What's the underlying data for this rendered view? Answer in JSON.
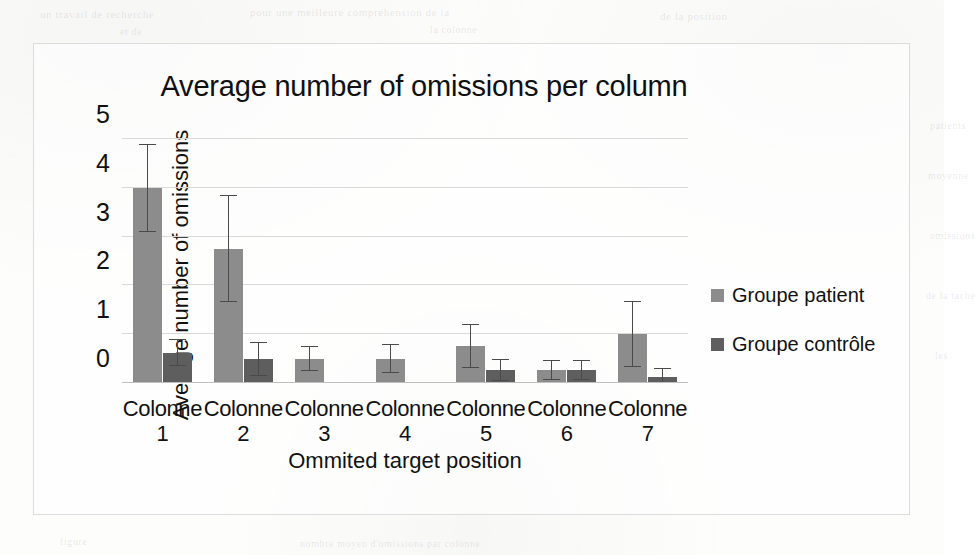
{
  "figure": {
    "border_color": "#dcdcdc",
    "background": "#fdfdfc"
  },
  "chart_data": {
    "type": "bar",
    "title": "Average number of omissions per column",
    "xlabel": "Ommited target position",
    "ylabel": "Average number of omissions",
    "categories": [
      "Colonne 1",
      "Colonne 2",
      "Colonne 3",
      "Colonne 4",
      "Colonne 5",
      "Colonne 6",
      "Colonne 7"
    ],
    "category_lines": [
      [
        "Colonne",
        "1"
      ],
      [
        "Colonne",
        "2"
      ],
      [
        "Colonne",
        "3"
      ],
      [
        "Colonne",
        "4"
      ],
      [
        "Colonne",
        "5"
      ],
      [
        "Colonne",
        "6"
      ],
      [
        "Colonne",
        "7"
      ]
    ],
    "ylim": [
      0,
      5
    ],
    "yticks": [
      0,
      1,
      2,
      3,
      4,
      5
    ],
    "ytick_labels": [
      "0",
      "1",
      "2",
      "3",
      "4",
      "5"
    ],
    "grid": true,
    "grid_axis": "y",
    "legend_position": "right",
    "error_bars": "symmetric",
    "series": [
      {
        "name": "Groupe patient",
        "color": "#8c8c8c",
        "values": [
          4.0,
          2.75,
          0.5,
          0.5,
          0.75,
          0.27,
          1.0
        ],
        "errors": [
          0.9,
          1.1,
          0.25,
          0.3,
          0.45,
          0.2,
          0.68
        ]
      },
      {
        "name": "Groupe contrôle",
        "color": "#5e5e5e",
        "values": [
          0.62,
          0.5,
          0.0,
          0.0,
          0.27,
          0.27,
          0.12
        ],
        "errors": [
          0.28,
          0.35,
          0.0,
          0.0,
          0.22,
          0.2,
          0.18
        ]
      }
    ]
  },
  "legend": {
    "items": [
      {
        "label": "Groupe patient",
        "color": "#8c8c8c"
      },
      {
        "label": "Groupe contrôle",
        "color": "#5e5e5e"
      }
    ]
  },
  "page_bleed": [
    {
      "text": "un travail de recherche",
      "x": 40,
      "y": 8,
      "size": 11
    },
    {
      "text": "pour une meilleure compréhension de la",
      "x": 250,
      "y": 6,
      "size": 11
    },
    {
      "text": "de la position",
      "x": 660,
      "y": 10,
      "size": 11
    },
    {
      "text": "et de",
      "x": 120,
      "y": 26,
      "size": 10
    },
    {
      "text": "la colonne",
      "x": 430,
      "y": 24,
      "size": 10
    },
    {
      "text": "patients",
      "x": 930,
      "y": 120,
      "size": 10
    },
    {
      "text": "moyenne",
      "x": 928,
      "y": 170,
      "size": 10
    },
    {
      "text": "omissions",
      "x": 930,
      "y": 230,
      "size": 10
    },
    {
      "text": "de la tache",
      "x": 926,
      "y": 290,
      "size": 10
    },
    {
      "text": "les",
      "x": 935,
      "y": 350,
      "size": 10
    },
    {
      "text": "figure",
      "x": 60,
      "y": 536,
      "size": 10
    },
    {
      "text": "nombre moyen d'omissions par colonne",
      "x": 300,
      "y": 538,
      "size": 10
    }
  ]
}
